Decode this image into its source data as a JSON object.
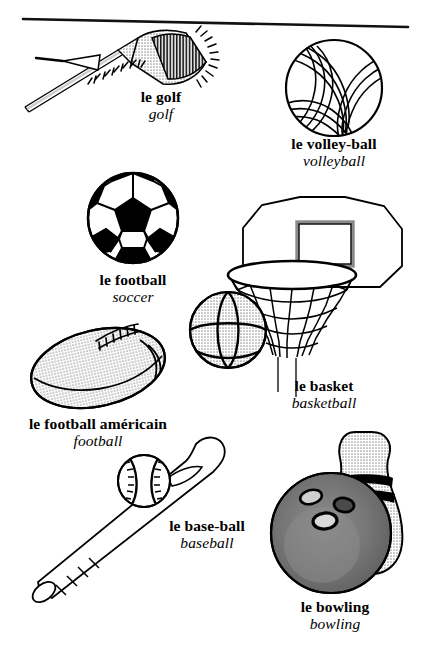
{
  "page": {
    "width": 429,
    "height": 670,
    "background_color": "#ffffff",
    "ink_color": "#000000",
    "topic": "les sports",
    "has_top_rule": true
  },
  "palette": {
    "ink": "#000000",
    "paper": "#ffffff",
    "light_gray_fill": "#d6d6d6",
    "mid_gray_fill": "#b3b3b3",
    "dark_gray_fill": "#7a7a7a",
    "ball_gray_fill": "#cfcfcf"
  },
  "entries": [
    {
      "id": "golf",
      "icon": "golf-club-icon",
      "fr": "le golf",
      "en": "golf",
      "caption_x": 161,
      "caption_y": 88
    },
    {
      "id": "volleyball",
      "icon": "volleyball-icon",
      "fr": "le volley-ball",
      "en": "volleyball",
      "caption_x": 334,
      "caption_y": 135
    },
    {
      "id": "soccer",
      "icon": "soccer-ball-icon",
      "fr": "le football",
      "en": "soccer",
      "caption_x": 133,
      "caption_y": 271
    },
    {
      "id": "basketball",
      "icon": "basketball-hoop-icon",
      "fr": "le basket",
      "en": "basketball",
      "caption_x": 324,
      "caption_y": 377
    },
    {
      "id": "football",
      "icon": "american-football-icon",
      "fr": "le football américain",
      "en": "football",
      "caption_x": 98,
      "caption_y": 415
    },
    {
      "id": "baseball",
      "icon": "baseball-bat-icon",
      "fr": "le base-ball",
      "en": "baseball",
      "caption_x": 207,
      "caption_y": 517
    },
    {
      "id": "bowling",
      "icon": "bowling-ball-icon",
      "fr": "le bowling",
      "en": "bowling",
      "caption_x": 335,
      "caption_y": 598
    }
  ]
}
